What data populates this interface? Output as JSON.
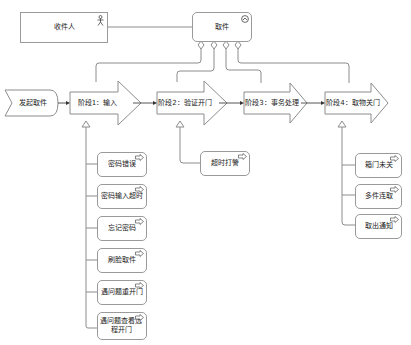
{
  "diagram": {
    "type": "business-process-flow",
    "actor": {
      "label": "收件人",
      "icon": "actor-icon"
    },
    "object": {
      "label": "取件",
      "icon": "function-chevron-icon"
    },
    "start_event": {
      "label": "发起取件"
    },
    "stages": [
      {
        "label": "阶段1：输入"
      },
      {
        "label": "阶段2：验证开门"
      },
      {
        "label": "阶段3：事务处理"
      },
      {
        "label": "阶段4：取物关门"
      }
    ],
    "stage1_exceptions": [
      {
        "label": "密码错误"
      },
      {
        "label": "密码输入超时"
      },
      {
        "label": "忘记密码"
      },
      {
        "label": "刷脸取件"
      },
      {
        "label": "遇问题重开门"
      },
      {
        "label": "遇问题查看远程开门"
      }
    ],
    "stage2_exceptions": [
      {
        "label": "超时打警"
      }
    ],
    "stage4_exceptions": [
      {
        "label": "箱门未关"
      },
      {
        "label": "多件连取"
      },
      {
        "label": "取出通知"
      }
    ],
    "colors": {
      "stroke": "#8c8c8c",
      "fill": "#ffffff",
      "text": "#222222"
    }
  }
}
